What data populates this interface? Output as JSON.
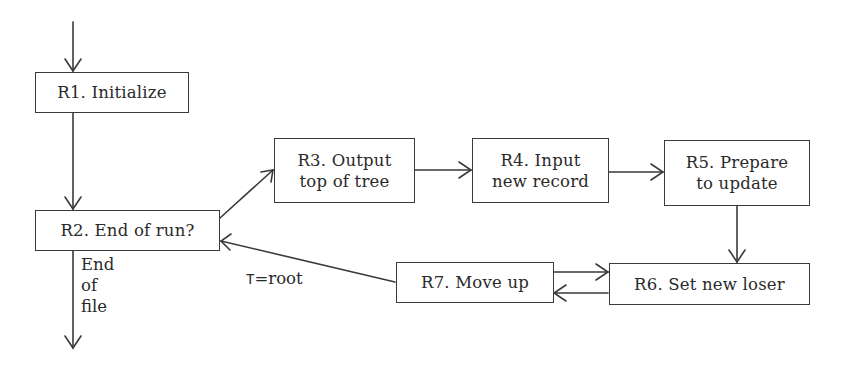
{
  "diagram": {
    "type": "flowchart",
    "nodes": [
      {
        "id": "R1",
        "lines": [
          "R1. Initialize"
        ]
      },
      {
        "id": "R2",
        "lines": [
          "R2. End of run?"
        ]
      },
      {
        "id": "R3",
        "lines": [
          "R3. Output",
          "top of tree"
        ]
      },
      {
        "id": "R4",
        "lines": [
          "R4. Input",
          "new record"
        ]
      },
      {
        "id": "R5",
        "lines": [
          "R5. Prepare",
          "to update"
        ]
      },
      {
        "id": "R6",
        "lines": [
          "R6. Set new loser"
        ]
      },
      {
        "id": "R7",
        "lines": [
          "R7. Move up"
        ]
      }
    ],
    "edges": [
      {
        "from": "start",
        "to": "R1",
        "label": ""
      },
      {
        "from": "R1",
        "to": "R2",
        "label": ""
      },
      {
        "from": "R2",
        "to": "R3",
        "label": ""
      },
      {
        "from": "R2",
        "to": "exit",
        "label": "End of file"
      },
      {
        "from": "R3",
        "to": "R4",
        "label": ""
      },
      {
        "from": "R4",
        "to": "R5",
        "label": ""
      },
      {
        "from": "R5",
        "to": "R6",
        "label": ""
      },
      {
        "from": "R6",
        "to": "R7",
        "label": ""
      },
      {
        "from": "R7",
        "to": "R6",
        "label": ""
      },
      {
        "from": "R7",
        "to": "R2",
        "label": "T = root"
      }
    ],
    "edge_labels": {
      "end_of_file": [
        "End",
        "of",
        "file"
      ],
      "t_root_var": "T",
      "t_root_eq": "=",
      "t_root_val": "root"
    },
    "colors": {
      "stroke": "#3a3a3a",
      "background": "#ffffff",
      "text": "#2a2a2a"
    }
  }
}
